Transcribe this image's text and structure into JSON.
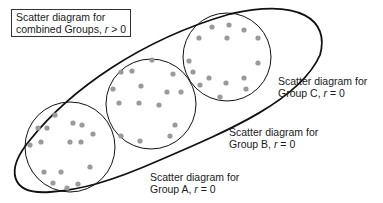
{
  "title_box": {
    "line1": "Scatter diagram for",
    "line2_prefix": "combined Groups, ",
    "r": "r",
    "line2_suffix": " > 0"
  },
  "labels": {
    "group_c": {
      "line1": "Scatter diagram for",
      "line2_prefix": "Group C, ",
      "r": "r",
      "line2_suffix": " = 0"
    },
    "group_b": {
      "line1": "Scatter diagram for",
      "line2_prefix": "Group B, ",
      "r": "r",
      "line2_suffix": " = 0"
    },
    "group_a": {
      "line1": "Scatter diagram for",
      "line2_prefix": "Group A, ",
      "r": "r",
      "line2_suffix": " = 0"
    }
  },
  "colors": {
    "dot": "#9a9a9a",
    "stroke": "#111111"
  },
  "groups": {
    "A": {
      "cx": 70,
      "cy": 147,
      "r": 45,
      "dots": [
        [
          55,
          115
        ],
        [
          38,
          128
        ],
        [
          47,
          128
        ],
        [
          73,
          123
        ],
        [
          82,
          125
        ],
        [
          93,
          134
        ],
        [
          30,
          145
        ],
        [
          41,
          142
        ],
        [
          70,
          142
        ],
        [
          81,
          142
        ],
        [
          44,
          172
        ],
        [
          61,
          172
        ],
        [
          90,
          167
        ],
        [
          53,
          183
        ],
        [
          67,
          188
        ],
        [
          78,
          184
        ]
      ]
    },
    "B": {
      "cx": 151,
      "cy": 104,
      "r": 45,
      "dots": [
        [
          152,
          60
        ],
        [
          121,
          72
        ],
        [
          132,
          71
        ],
        [
          173,
          74
        ],
        [
          113,
          89
        ],
        [
          141,
          86
        ],
        [
          167,
          92
        ],
        [
          181,
          92
        ],
        [
          119,
          103
        ],
        [
          139,
          103
        ],
        [
          159,
          105
        ],
        [
          175,
          125
        ],
        [
          121,
          136
        ],
        [
          140,
          141
        ],
        [
          170,
          136
        ]
      ]
    },
    "C": {
      "cx": 227,
      "cy": 57,
      "r": 44,
      "dots": [
        [
          212,
          27
        ],
        [
          229,
          25
        ],
        [
          244,
          30
        ],
        [
          199,
          38
        ],
        [
          227,
          38
        ],
        [
          258,
          38
        ],
        [
          258,
          63
        ],
        [
          189,
          61
        ],
        [
          193,
          72
        ],
        [
          209,
          78
        ],
        [
          226,
          83
        ],
        [
          244,
          78
        ],
        [
          200,
          85
        ],
        [
          246,
          89
        ],
        [
          220,
          97
        ]
      ]
    }
  }
}
